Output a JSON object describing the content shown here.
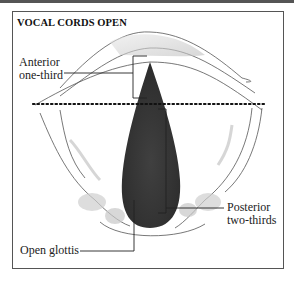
{
  "diagram": {
    "title": "VOCAL CORDS OPEN",
    "labels": {
      "anterior_line1": "Anterior",
      "anterior_line2": "one-third",
      "posterior_line1": "Posterior",
      "posterior_line2": "two-thirds",
      "open_glottis": "Open glottis"
    },
    "colors": {
      "frame": "#555555",
      "glottis_fill": "#3a3a3a",
      "dotted_line": "#111111",
      "outline": "#444444"
    }
  }
}
